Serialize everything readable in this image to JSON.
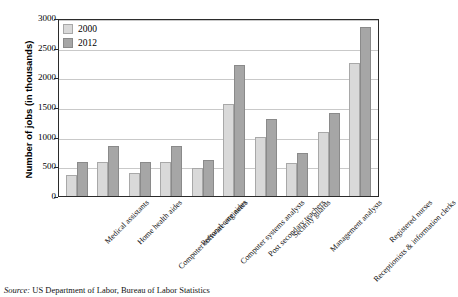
{
  "chart_data": {
    "type": "bar",
    "title": "",
    "xlabel": "",
    "ylabel": "Number of jobs (in thousands)",
    "ylim": [
      0,
      3000
    ],
    "ytick_step": 500,
    "yticks": [
      "0",
      "500",
      "1000",
      "1500",
      "2000",
      "2500",
      "3000"
    ],
    "grid": true,
    "legend_position": "top-left",
    "categories": [
      "Medical assistants",
      "Home health aides",
      "Computer software engineers",
      "Personal care aides",
      "Computer systems analysts",
      "Post secondary teachers",
      "Security guards",
      "Management analysts",
      "Receptionists & information clerks",
      "Registered nurses"
    ],
    "series": [
      {
        "name": "2000",
        "color": "#d9d9d9",
        "values": [
          360,
          565,
          380,
          565,
          470,
          1550,
          1000,
          550,
          1085,
          2250
        ]
      },
      {
        "name": "2012",
        "color": "#a6a6a6",
        "values": [
          565,
          850,
          565,
          850,
          615,
          2200,
          1300,
          720,
          1400,
          2850
        ]
      }
    ]
  },
  "legend": {
    "entries": [
      {
        "label": "2000"
      },
      {
        "label": "2012"
      }
    ]
  },
  "source": {
    "prefix": "Source:",
    "text": "US Department of Labor, Bureau of Labor Statistics"
  }
}
